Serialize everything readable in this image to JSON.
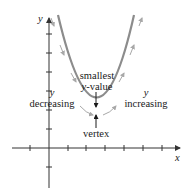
{
  "figure": {
    "axes": {
      "x_label": "x",
      "y_label": "y"
    },
    "annotations": {
      "smallest_line1": "smallest",
      "smallest_line2": "y-value",
      "vertex": "vertex",
      "left_y": "y",
      "left_text": "decreasing",
      "right_y": "y",
      "right_text": "increasing"
    },
    "colors": {
      "curve": "#8c8c8c",
      "axes": "#333333",
      "arrows": "#a8a8a8",
      "text": "#1a1a1a"
    }
  }
}
